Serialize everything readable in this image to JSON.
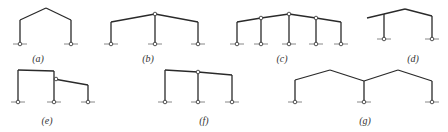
{
  "diagram": {
    "colors": {
      "member": "#2a2a2a",
      "ground": "#6a6a6a",
      "label": "#333333",
      "background": "#ffffff"
    },
    "frames": [
      {
        "id": "a",
        "label": "(a)",
        "label_pos": [
          38,
          62
        ],
        "members": [
          [
            [
              20,
              20
            ],
            [
              20,
              44
            ]
          ],
          [
            [
              20,
              20
            ],
            [
              46,
              8
            ]
          ],
          [
            [
              46,
              8
            ],
            [
              71,
              20
            ]
          ],
          [
            [
              71,
              20
            ],
            [
              71,
              44
            ]
          ]
        ],
        "supports": [
          [
            20,
            44
          ],
          [
            71,
            44
          ]
        ],
        "hinges": []
      },
      {
        "id": "b",
        "label": "(b)",
        "label_pos": [
          148,
          62
        ],
        "members": [
          [
            [
              111,
              22
            ],
            [
              111,
              44
            ]
          ],
          [
            [
              111,
              22
            ],
            [
              155,
              14
            ]
          ],
          [
            [
              155,
              14
            ],
            [
              198,
              22
            ]
          ],
          [
            [
              198,
              22
            ],
            [
              198,
              44
            ]
          ],
          [
            [
              155,
              14
            ],
            [
              155,
              44
            ]
          ]
        ],
        "supports": [
          [
            111,
            44
          ],
          [
            155,
            44
          ],
          [
            198,
            44
          ]
        ],
        "hinges": [
          [
            155,
            14
          ]
        ]
      },
      {
        "id": "c",
        "label": "(c)",
        "label_pos": [
          282,
          62
        ],
        "members": [
          [
            [
              237,
              22
            ],
            [
              237,
              44
            ]
          ],
          [
            [
              237,
              22
            ],
            [
              261,
              18
            ]
          ],
          [
            [
              261,
              18
            ],
            [
              289,
              14
            ]
          ],
          [
            [
              289,
              14
            ],
            [
              316,
              18
            ]
          ],
          [
            [
              316,
              18
            ],
            [
              341,
              22
            ]
          ],
          [
            [
              341,
              22
            ],
            [
              341,
              44
            ]
          ],
          [
            [
              261,
              18
            ],
            [
              261,
              44
            ]
          ],
          [
            [
              289,
              14
            ],
            [
              289,
              44
            ]
          ],
          [
            [
              316,
              18
            ],
            [
              316,
              44
            ]
          ]
        ],
        "supports": [
          [
            237,
            44
          ],
          [
            261,
            44
          ],
          [
            289,
            44
          ],
          [
            316,
            44
          ],
          [
            341,
            44
          ]
        ],
        "hinges": [
          [
            261,
            18
          ],
          [
            289,
            14
          ],
          [
            316,
            18
          ]
        ]
      },
      {
        "id": "d",
        "label": "(d)",
        "label_pos": [
          413,
          62
        ],
        "members": [
          [
            [
              367,
              18
            ],
            [
              384,
              14
            ]
          ],
          [
            [
              384,
              14
            ],
            [
              405,
              9
            ]
          ],
          [
            [
              405,
              9
            ],
            [
              432,
              16
            ]
          ],
          [
            [
              384,
              14
            ],
            [
              384,
              39
            ]
          ],
          [
            [
              432,
              16
            ],
            [
              432,
              39
            ]
          ]
        ],
        "supports": [
          [
            384,
            39
          ],
          [
            432,
            39
          ]
        ],
        "hinges": []
      },
      {
        "id": "e",
        "label": "(e)",
        "label_pos": [
          47,
          124
        ],
        "members": [
          [
            [
              18,
              70
            ],
            [
              18,
              102
            ]
          ],
          [
            [
              18,
              70
            ],
            [
              54,
              71
            ]
          ],
          [
            [
              54,
              71
            ],
            [
              54,
              102
            ]
          ],
          [
            [
              54,
              79
            ],
            [
              88,
              85
            ]
          ],
          [
            [
              88,
              85
            ],
            [
              88,
              102
            ]
          ]
        ],
        "supports": [
          [
            18,
            102
          ],
          [
            54,
            102
          ],
          [
            88,
            102
          ]
        ],
        "hinges": [
          [
            56,
            79
          ]
        ]
      },
      {
        "id": "f",
        "label": "(f)",
        "label_pos": [
          204,
          124
        ],
        "members": [
          [
            [
              165,
              70
            ],
            [
              165,
              102
            ]
          ],
          [
            [
              165,
              70
            ],
            [
              198,
              72
            ]
          ],
          [
            [
              198,
              72
            ],
            [
              232,
              75
            ]
          ],
          [
            [
              198,
              72
            ],
            [
              198,
              102
            ]
          ],
          [
            [
              232,
              75
            ],
            [
              232,
              102
            ]
          ]
        ],
        "supports": [
          [
            165,
            102
          ],
          [
            198,
            102
          ],
          [
            232,
            102
          ]
        ],
        "hinges": [
          [
            198,
            72
          ]
        ]
      },
      {
        "id": "g",
        "label": "(g)",
        "label_pos": [
          365,
          124
        ],
        "members": [
          [
            [
              295,
              80
            ],
            [
              295,
              102
            ]
          ],
          [
            [
              295,
              80
            ],
            [
              330,
              70
            ]
          ],
          [
            [
              330,
              70
            ],
            [
              364,
              81
            ]
          ],
          [
            [
              364,
              81
            ],
            [
              364,
              102
            ]
          ],
          [
            [
              364,
              81
            ],
            [
              398,
              70
            ]
          ],
          [
            [
              398,
              70
            ],
            [
              432,
              81
            ]
          ],
          [
            [
              432,
              81
            ],
            [
              432,
              102
            ]
          ]
        ],
        "supports": [
          [
            295,
            102
          ],
          [
            364,
            102
          ],
          [
            432,
            102
          ]
        ],
        "hinges": []
      }
    ],
    "labels": [
      "(a)",
      "(b)",
      "(c)",
      "(d)",
      "(e)",
      "(f)",
      "(g)"
    ]
  }
}
